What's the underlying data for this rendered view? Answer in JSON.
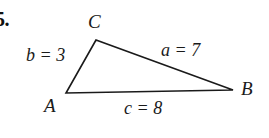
{
  "figure": {
    "problem_number": "5.",
    "background_color": "#ffffff",
    "stroke_color": "#1a1a1a",
    "text_color": "#1a1a1a",
    "width": 269,
    "height": 138,
    "type": "triangle-diagram"
  },
  "vertices": [
    {
      "name": "C",
      "label": "C",
      "x": 96,
      "y": 40
    },
    {
      "name": "A",
      "label": "A",
      "x": 66,
      "y": 93
    },
    {
      "name": "B",
      "label": "B",
      "x": 233,
      "y": 90
    }
  ],
  "sides": [
    {
      "name": "b",
      "label": "b = 3",
      "value": 3,
      "variable": "b",
      "between": "A-C"
    },
    {
      "name": "a",
      "label": "a = 7",
      "value": 7,
      "variable": "a",
      "between": "C-B"
    },
    {
      "name": "c",
      "label": "c = 8",
      "value": 8,
      "variable": "c",
      "between": "A-B"
    }
  ],
  "geometry": {
    "path": "M 66,93 L 96,40 L 233,90 Z"
  }
}
